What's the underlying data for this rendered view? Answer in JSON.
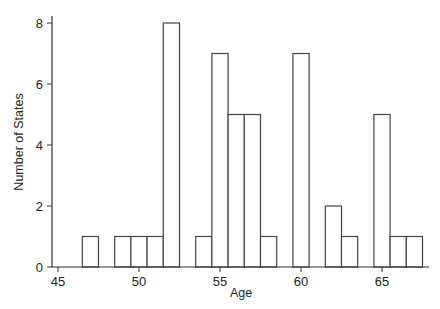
{
  "chart_data": {
    "type": "bar",
    "title": "",
    "xlabel": "Age",
    "ylabel": "Number of States",
    "x": [
      47,
      49,
      50,
      51,
      52,
      54,
      55,
      56,
      57,
      58,
      60,
      62,
      63,
      65,
      66,
      67
    ],
    "values": [
      1,
      1,
      1,
      1,
      8,
      1,
      7,
      5,
      5,
      1,
      7,
      2,
      1,
      5,
      1,
      1
    ],
    "bin_width": 1,
    "xlim": [
      44.6,
      68
    ],
    "ylim": [
      0,
      8.2
    ],
    "xticks": [
      45,
      50,
      55,
      60,
      65
    ],
    "yticks": [
      0,
      2,
      4,
      6,
      8
    ],
    "grid": false,
    "legend": "none",
    "colors": {
      "bar_fill": "#ffffff",
      "bar_edge": "#444444",
      "axis": "#333333"
    }
  }
}
